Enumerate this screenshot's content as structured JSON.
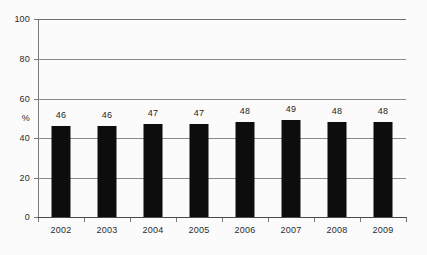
{
  "chart_data": {
    "type": "bar",
    "title": "",
    "subtitle": "",
    "xlabel": "",
    "ylabel": "%",
    "categories": [
      "2002",
      "2003",
      "2004",
      "2005",
      "2006",
      "2007",
      "2008",
      "2009"
    ],
    "values": [
      46,
      46,
      47,
      47,
      48,
      49,
      48,
      48
    ],
    "data_labels": [
      "46",
      "46",
      "47",
      "47",
      "48",
      "49",
      "48",
      "48"
    ],
    "ylim": [
      0,
      100
    ],
    "ytick_labels": [
      "100",
      "80",
      "60",
      "40",
      "20",
      "0"
    ],
    "ytick_values": [
      100,
      80,
      60,
      40,
      20,
      0
    ],
    "grid": true,
    "grid_axis": "y",
    "legend": false,
    "legend_position": "none",
    "bar_color": "#0d0d0d",
    "background_color": "#fbfbfb",
    "gridline_color": "#8b8b8b",
    "axis_color": "#4a4a4a",
    "text_color": "#2b2b2b"
  }
}
